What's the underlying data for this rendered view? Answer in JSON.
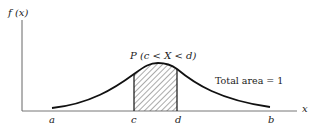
{
  "diagram": {
    "y_axis_label": "f (x)",
    "x_axis_label": "x",
    "region_label": "P (c < X < d)",
    "total_area_label": "Total area = 1",
    "points": {
      "a": "a",
      "c": "c",
      "d": "d",
      "b": "b"
    },
    "colors": {
      "curve": "#111111",
      "axis": "#555555",
      "hatch": "#444444",
      "background": "#ffffff"
    }
  }
}
